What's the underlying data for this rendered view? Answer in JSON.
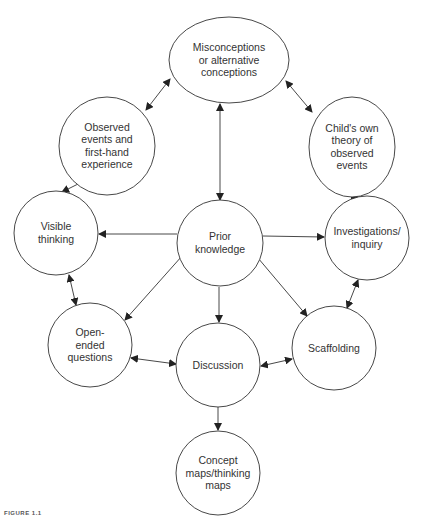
{
  "diagram": {
    "type": "concept-map",
    "nodes": [
      {
        "id": "misconceptions",
        "shape": "ellipse",
        "cx": 229,
        "cy": 60,
        "rx": 60,
        "ry": 43,
        "lines": [
          "Misconceptions",
          "or alternative",
          "conceptions"
        ]
      },
      {
        "id": "observed",
        "shape": "ellipse",
        "cx": 107,
        "cy": 146,
        "rx": 48,
        "ry": 49,
        "lines": [
          "Observed",
          "events and",
          "first-hand",
          "experience"
        ]
      },
      {
        "id": "childs-theory",
        "shape": "ellipse",
        "cx": 352,
        "cy": 147,
        "rx": 43,
        "ry": 50,
        "lines": [
          "Child's own",
          "theory of",
          "observed",
          "events"
        ]
      },
      {
        "id": "visible-thinking",
        "shape": "circle",
        "cx": 56,
        "cy": 233,
        "rx": 42,
        "ry": 42,
        "lines": [
          "Visible",
          "thinking"
        ]
      },
      {
        "id": "prior-knowledge",
        "shape": "circle",
        "cx": 220,
        "cy": 243,
        "rx": 43,
        "ry": 43,
        "lines": [
          "Prior",
          "knowledge"
        ]
      },
      {
        "id": "investigations",
        "shape": "circle",
        "cx": 367,
        "cy": 238,
        "rx": 42,
        "ry": 42,
        "lines": [
          "Investigations/",
          "inquiry"
        ]
      },
      {
        "id": "open-ended",
        "shape": "circle",
        "cx": 90,
        "cy": 345,
        "rx": 42,
        "ry": 42,
        "lines": [
          "Open-",
          "ended",
          "questions"
        ]
      },
      {
        "id": "discussion",
        "shape": "circle",
        "cx": 218,
        "cy": 365,
        "rx": 42,
        "ry": 42,
        "lines": [
          "Discussion"
        ]
      },
      {
        "id": "scaffolding",
        "shape": "circle",
        "cx": 334,
        "cy": 348,
        "rx": 42,
        "ry": 42,
        "lines": [
          "Scaffolding"
        ]
      },
      {
        "id": "concept-maps",
        "shape": "circle",
        "cx": 218,
        "cy": 473,
        "rx": 42,
        "ry": 42,
        "lines": [
          "Concept",
          "maps/thinking",
          "maps"
        ]
      }
    ],
    "edges": [
      {
        "from": "misconceptions",
        "to": "observed",
        "x1": 170,
        "y1": 79,
        "x2": 146,
        "y2": 110,
        "start_arrow": true,
        "end_arrow": true
      },
      {
        "from": "misconceptions",
        "to": "childs-theory",
        "x1": 286,
        "y1": 81,
        "x2": 312,
        "y2": 112,
        "start_arrow": true,
        "end_arrow": true
      },
      {
        "from": "misconceptions",
        "to": "prior-knowledge",
        "x1": 220,
        "y1": 104,
        "x2": 220,
        "y2": 200,
        "start_arrow": true,
        "end_arrow": true
      },
      {
        "from": "observed",
        "to": "visible-thinking",
        "x1": 78,
        "y1": 184,
        "x2": 62,
        "y2": 192,
        "start_arrow": false,
        "end_arrow": true
      },
      {
        "from": "childs-theory",
        "to": "investigations",
        "x1": 351,
        "y1": 196,
        "x2": 358,
        "y2": 196,
        "start_arrow": true,
        "end_arrow": true
      },
      {
        "from": "prior-knowledge",
        "to": "visible-thinking",
        "x1": 177,
        "y1": 234,
        "x2": 99,
        "y2": 234,
        "start_arrow": false,
        "end_arrow": true
      },
      {
        "from": "prior-knowledge",
        "to": "investigations",
        "x1": 263,
        "y1": 236,
        "x2": 324,
        "y2": 237,
        "start_arrow": false,
        "end_arrow": true
      },
      {
        "from": "prior-knowledge",
        "to": "open-ended",
        "x1": 182,
        "y1": 256,
        "x2": 125,
        "y2": 320,
        "start_arrow": false,
        "end_arrow": true
      },
      {
        "from": "prior-knowledge",
        "to": "discussion",
        "x1": 219,
        "y1": 287,
        "x2": 219,
        "y2": 322,
        "start_arrow": false,
        "end_arrow": true
      },
      {
        "from": "prior-knowledge",
        "to": "scaffolding",
        "x1": 258,
        "y1": 258,
        "x2": 307,
        "y2": 316,
        "start_arrow": false,
        "end_arrow": true
      },
      {
        "from": "visible-thinking",
        "to": "open-ended",
        "x1": 69,
        "y1": 275,
        "x2": 76,
        "y2": 305,
        "start_arrow": true,
        "end_arrow": true
      },
      {
        "from": "investigations",
        "to": "scaffolding",
        "x1": 358,
        "y1": 280,
        "x2": 347,
        "y2": 308,
        "start_arrow": true,
        "end_arrow": true
      },
      {
        "from": "open-ended",
        "to": "discussion",
        "x1": 131,
        "y1": 358,
        "x2": 176,
        "y2": 364,
        "start_arrow": true,
        "end_arrow": true
      },
      {
        "from": "discussion",
        "to": "scaffolding",
        "x1": 261,
        "y1": 366,
        "x2": 292,
        "y2": 359,
        "start_arrow": true,
        "end_arrow": true
      },
      {
        "from": "discussion",
        "to": "concept-maps",
        "x1": 218,
        "y1": 407,
        "x2": 218,
        "y2": 430,
        "start_arrow": false,
        "end_arrow": true
      }
    ],
    "stroke_color": "#333333",
    "fill_color": "#ffffff",
    "text_color": "#333333"
  },
  "caption": "FIGURE 1.1"
}
